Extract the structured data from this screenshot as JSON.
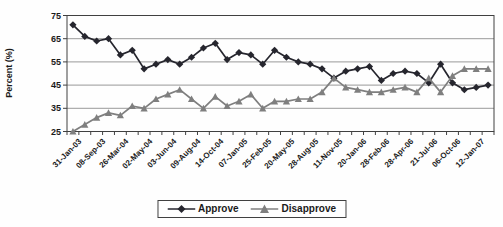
{
  "chart_data": {
    "type": "line",
    "title": "",
    "xlabel": "",
    "ylabel": "Percent (%)",
    "ylim": [
      25,
      75
    ],
    "yticks": [
      25,
      35,
      45,
      55,
      65,
      75
    ],
    "grid": "horizontal",
    "legend_position": "bottom-center",
    "n_points": 36,
    "x_label_every": 2,
    "x_tick_labels": [
      "31-Jan-03",
      "08-Sep-03",
      "26-Mar-04",
      "02-May-04",
      "03-Jun-04",
      "09-Aug-04",
      "14-Oct-04",
      "07-Jan-05",
      "25-Feb-05",
      "20-May-05",
      "28-Aug-05",
      "11-Nov-05",
      "20-Jan-06",
      "28-Feb-06",
      "28-Apr-06",
      "21-Jul-06",
      "06-Oct-06",
      "12-Jan-07"
    ],
    "series": [
      {
        "name": "Approve",
        "marker": "diamond",
        "color": "#26262e",
        "values": [
          71,
          66,
          64,
          65,
          58,
          60,
          52,
          54,
          56,
          54,
          57,
          61,
          63,
          56,
          59,
          58,
          54,
          60,
          57,
          55,
          54,
          52,
          48,
          51,
          52,
          53,
          47,
          50,
          51,
          50,
          46,
          54,
          46,
          43,
          44,
          45
        ]
      },
      {
        "name": "Disapprove",
        "marker": "triangle",
        "color": "#7f7f7f",
        "values": [
          25,
          28,
          31,
          33,
          32,
          36,
          35,
          39,
          41,
          43,
          39,
          35,
          40,
          36,
          38,
          41,
          35,
          38,
          38,
          39,
          39,
          42,
          48,
          44,
          43,
          42,
          42,
          43,
          44,
          42,
          48,
          42,
          49,
          52,
          52,
          52
        ]
      }
    ],
    "colors": {
      "gridline": "#808080",
      "axis": "#404040",
      "text": "#1a1a1a"
    }
  }
}
